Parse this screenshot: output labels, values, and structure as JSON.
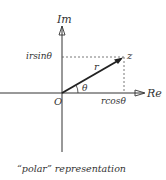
{
  "diagram": {
    "axes": {
      "imaginary_label": "Im",
      "real_label": "Re"
    },
    "labels": {
      "origin": "O",
      "point": "z",
      "modulus": "r",
      "angle": "θ",
      "imaginary_projection": "irsinθ",
      "real_projection": "rcosθ"
    },
    "caption": "“polar” representation",
    "colors": {
      "ink": "#333333",
      "background": "#ffffff"
    }
  }
}
